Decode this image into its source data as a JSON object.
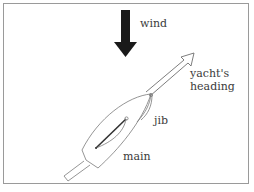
{
  "diagram": {
    "labels": {
      "wind": "wind",
      "heading_line1": "yacht's",
      "heading_line2": "heading",
      "jib": "jib",
      "main": "main"
    },
    "colors": {
      "frame": "#9a9a9a",
      "wind_arrow": "#1a1a1a",
      "outline": "#6e6e6e",
      "mainsail_boom": "#333333",
      "text": "#3a3a3a"
    }
  }
}
